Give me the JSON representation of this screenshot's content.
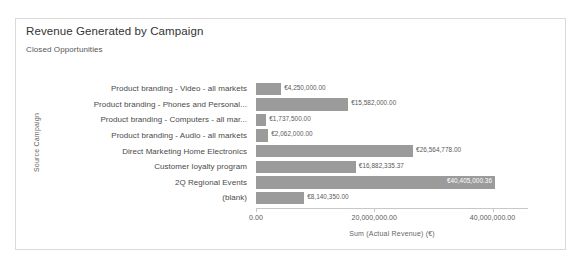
{
  "visual": {
    "title": "Revenue Generated by Campaign",
    "subtitle": "Closed Opportunities"
  },
  "chart_data": {
    "type": "bar",
    "orientation": "horizontal",
    "title": "Revenue Generated by Campaign",
    "subtitle": "Closed Opportunities",
    "xlabel": "Sum (Actual Revenue) (€)",
    "ylabel": "Source Campaign",
    "xlim": [
      0,
      46000000
    ],
    "grid": false,
    "legend": null,
    "bar_color": "#9b9b9b",
    "categories": [
      "Product branding - Video - all markets",
      "Product branding - Phones and Personal...",
      "Product branding - Computers - all mar...",
      "Product branding - Audio - all markets",
      "Direct Marketing Home Electronics",
      "Customer loyalty program",
      "2Q Regional Events",
      "(blank)"
    ],
    "values": [
      4250000.0,
      15582000.0,
      1737500.0,
      2062000.0,
      26564778.0,
      16882335.37,
      40405000.36,
      8140350.0
    ],
    "value_labels": [
      "€4,250,000.00",
      "€15,582,000.00",
      "€1,737,500.00",
      "€2,062,000.00",
      "€26,564,778.00",
      "€16,882,335.37",
      "€40,405,000.36",
      "€8,140,350.00"
    ],
    "label_position": [
      "outside",
      "outside",
      "outside",
      "outside",
      "outside",
      "outside",
      "inside",
      "outside"
    ],
    "xticks": [
      0,
      20000000,
      40000000
    ],
    "xtick_labels": [
      "0.00",
      "20,000,000.00",
      "40,000,000.00"
    ]
  }
}
